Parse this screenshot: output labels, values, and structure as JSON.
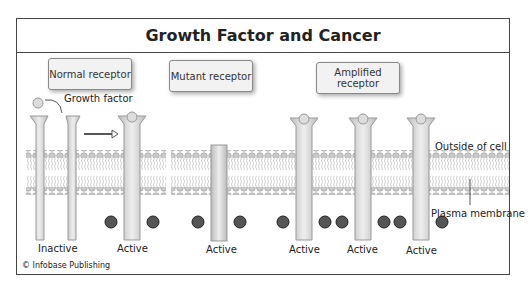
{
  "title": "Growth Factor and Cancer",
  "boxes": {
    "normal": "Normal receptor",
    "mutant": "Mutant receptor",
    "amplified": "Amplified receptor"
  },
  "labels": {
    "growth_factor": "Growth factor",
    "outside": "Outside of cell",
    "membrane": "Plasma membrane",
    "phosphate": "P"
  },
  "states": [
    "Inactive",
    "Active",
    "Active",
    "Active",
    "Active",
    "Active"
  ],
  "copyright": "© Infobase Publishing"
}
